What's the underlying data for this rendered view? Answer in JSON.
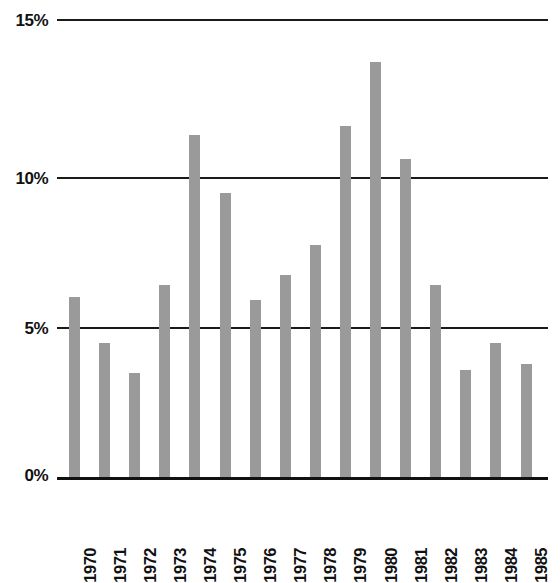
{
  "chart_data": {
    "type": "bar",
    "title": "",
    "subtitle": "",
    "xlabel": "",
    "ylabel": "",
    "categories": [
      "1970",
      "1971",
      "1972",
      "1973",
      "1974",
      "1975",
      "1976",
      "1977",
      "1978",
      "1979",
      "1980",
      "1981",
      "1982",
      "1983",
      "1984",
      "1985"
    ],
    "values": [
      5.9,
      4.4,
      3.4,
      6.3,
      11.2,
      9.3,
      5.8,
      6.6,
      7.6,
      11.5,
      13.6,
      10.4,
      6.3,
      3.5,
      4.4,
      3.7
    ],
    "ylim": [
      0,
      15
    ],
    "yticks": [
      0,
      5,
      10,
      15
    ],
    "ytick_labels": [
      "0%",
      "5%",
      "10%",
      "15%"
    ],
    "grid": true,
    "grid_axis": "y",
    "legend": false,
    "legend_position": "none",
    "bar_color": "#9a9a9a",
    "grid_color": "#1a1a1a",
    "axis_color": "#111111",
    "background": "#ffffff",
    "value_unit": "%",
    "annotations": []
  }
}
